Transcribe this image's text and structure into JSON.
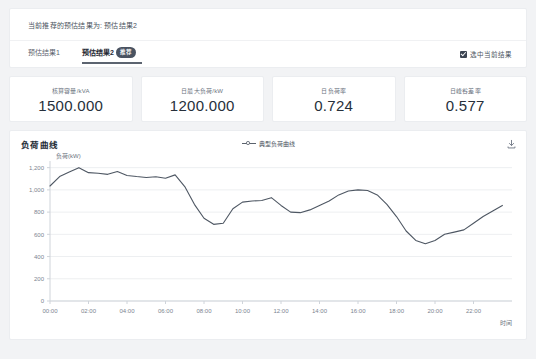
{
  "panel": {
    "recommend_text": "当前推荐的预估结果为: 预估结果2",
    "tabs": [
      {
        "label": "预估结果1",
        "active": false,
        "badge": ""
      },
      {
        "label": "预估结果2",
        "active": true,
        "badge": "推荐"
      }
    ],
    "select_current_label": "选中当前结果",
    "select_current_checked": true
  },
  "metrics": [
    {
      "label": "核算容量/kVA",
      "value": "1500.000"
    },
    {
      "label": "日最大负荷/kW",
      "value": "1200.000"
    },
    {
      "label": "日负荷率",
      "value": "0.724"
    },
    {
      "label": "日峰谷差率",
      "value": "0.577"
    }
  ],
  "chart_card": {
    "title": "负荷曲线",
    "legend_label": "典型负荷曲线",
    "download_icon": "download-icon"
  },
  "colors": {
    "page_background": "#f2f3f5",
    "card_background": "#ffffff",
    "card_border": "#ebedf0",
    "text_primary": "#262f3a",
    "text_secondary": "#6b7380",
    "series_line": "#4e5763",
    "grid": "#edeff1",
    "badge_background": "#4a5361",
    "checkbox_checked": "#3b4452"
  },
  "chart_data": {
    "type": "line",
    "title": "负荷曲线",
    "xlabel": "时间",
    "ylabel": "负荷(kW)",
    "legend": [
      "典型负荷曲线"
    ],
    "legend_position": "top-center",
    "grid": true,
    "ylim": [
      0,
      1260
    ],
    "yticks": [
      0,
      200,
      400,
      600,
      800,
      1000,
      1200
    ],
    "ytick_labels": [
      "0",
      "200",
      "400",
      "600",
      "800",
      "1,000",
      "1,200"
    ],
    "xlim": [
      "00:00",
      "24:00"
    ],
    "xticks": [
      "00:00",
      "02:00",
      "04:00",
      "06:00",
      "08:00",
      "10:00",
      "12:00",
      "14:00",
      "16:00",
      "18:00",
      "20:00",
      "22:00"
    ],
    "x": [
      "00:00",
      "00:30",
      "01:00",
      "01:30",
      "02:00",
      "02:30",
      "03:00",
      "03:30",
      "04:00",
      "04:30",
      "05:00",
      "05:30",
      "06:00",
      "06:30",
      "07:00",
      "07:30",
      "08:00",
      "08:30",
      "09:00",
      "09:30",
      "10:00",
      "10:30",
      "11:00",
      "11:30",
      "12:00",
      "12:30",
      "13:00",
      "13:30",
      "14:00",
      "14:30",
      "15:00",
      "15:30",
      "16:00",
      "16:30",
      "17:00",
      "17:30",
      "18:00",
      "18:30",
      "19:00",
      "19:30",
      "20:00",
      "20:30",
      "21:00",
      "21:30",
      "22:00",
      "22:30",
      "23:00",
      "23:30"
    ],
    "series": [
      {
        "name": "典型负荷曲线",
        "values": [
          1035,
          1120,
          1160,
          1200,
          1155,
          1150,
          1140,
          1165,
          1130,
          1120,
          1112,
          1118,
          1105,
          1135,
          1030,
          870,
          745,
          690,
          700,
          830,
          890,
          900,
          905,
          930,
          860,
          800,
          795,
          820,
          860,
          900,
          955,
          990,
          1000,
          995,
          955,
          870,
          760,
          630,
          545,
          515,
          545,
          600,
          620,
          640,
          700,
          760,
          810,
          860
        ]
      }
    ]
  }
}
